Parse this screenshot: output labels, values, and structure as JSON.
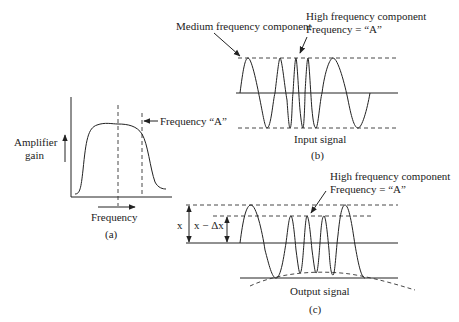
{
  "panel_a": {
    "caption": "(a)",
    "y_label_line1": "Amplifier",
    "y_label_line2": "gain",
    "x_label": "Frequency",
    "marker_label": "Frequency “A”"
  },
  "panel_b": {
    "caption": "(b)",
    "signal_label": "Input signal",
    "medium_label": "Medium frequency component",
    "high_label_line1": "High frequency component",
    "high_label_line2": "Frequency = “A”"
  },
  "panel_c": {
    "caption": "(c)",
    "signal_label": "Output signal",
    "high_label_line1": "High frequency component",
    "high_label_line2": "Frequency = “A”",
    "x_label": "x",
    "x_minus_label": "x − Δx"
  }
}
